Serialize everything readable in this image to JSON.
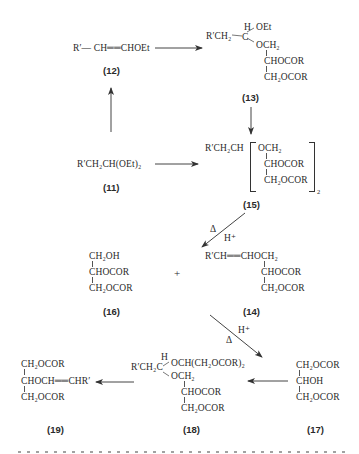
{
  "compounds": {
    "c12": {
      "label": "(12)",
      "formula": "R′— CH══CHOEt"
    },
    "c13": {
      "label": "(13)",
      "r": "R′CH₂",
      "h": "H",
      "oet": "OEt",
      "c": "C",
      "och2": "OCH₂",
      "chocor": "CHOCOR",
      "ch2ocor": "CH₂OCOR"
    },
    "c11": {
      "label": "(11)",
      "formula": "R′CH₂CH(OEt)₂"
    },
    "c15": {
      "label": "(15)",
      "r": "R′CH₂CH",
      "och2": "OCH₂",
      "chocor": "CHOCOR",
      "ch2ocor": "CH₂OCOR",
      "subscript": "2"
    },
    "c16": {
      "label": "(16)",
      "line1": "CH₂OH",
      "line2": "CHOCOR",
      "line3": "CH₂OCOR"
    },
    "c14": {
      "label": "(14)",
      "line1": "R′CH══CHOCH₂",
      "line2": "CHOCOR",
      "line3": "CH₂OCOR"
    },
    "c17": {
      "label": "(17)",
      "line1": "CH₂OCOR",
      "line2": "CHOH",
      "line3": "CH₂OCOR"
    },
    "c18": {
      "label": "(18)",
      "r": "R′CH₂C",
      "h": "H",
      "branch": "OCH(CH₂OCOR)₂",
      "och2": "OCH₂",
      "chocor": "CHOCOR",
      "ch2ocor": "CH₂OCOR"
    },
    "c19": {
      "label": "(19)",
      "line1": "CH₂OCOR",
      "line2": "CHOCH══CHR′",
      "line3": "CH₂OCOR"
    }
  },
  "plus_sign": "+",
  "conditions": {
    "step15_14": {
      "heat": "Δ",
      "acid": "H⁺"
    },
    "step14_17": {
      "heat": "Δ",
      "acid": "H⁺"
    }
  },
  "footer_text_cut": "…(?) …"
}
